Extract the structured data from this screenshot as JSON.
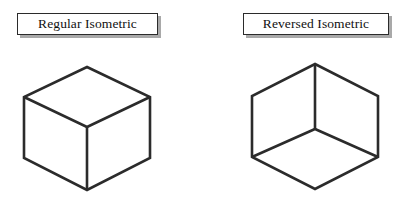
{
  "figure": {
    "background_color": "#ffffff",
    "line_color": "#2b2b2b",
    "shadow_color": "#a9a9a9",
    "text_color": "#111111"
  },
  "panels": [
    {
      "id": "regular",
      "label": "Regular Isometric",
      "cube": {
        "orientation": "viewed-from-above",
        "visible_faces": [
          "top",
          "left",
          "right"
        ],
        "interior_vertex": "pointing-down",
        "apex_vertex": "top",
        "description": "Standard isometric cube: top face visible as a diamond, interior Y-junction points downward."
      }
    },
    {
      "id": "reversed",
      "label": "Reversed Isometric",
      "cube": {
        "orientation": "viewed-from-below",
        "visible_faces": [
          "bottom",
          "left",
          "right"
        ],
        "interior_vertex": "pointing-up",
        "apex_vertex": "bottom",
        "description": "Reversed isometric cube: bottom face visible as a diamond, interior Y-junction points upward."
      }
    }
  ],
  "geometry": {
    "regular": {
      "outline": "63,9 0,39 0,100 63,132 126,100 126,39",
      "top_face": "63,9 126,39 63,69 0,39",
      "spoke_center": "63,69",
      "spoke_down_to": "63,132",
      "spoke_left_to": "0,39",
      "spoke_right_to": "126,39"
    },
    "reversed": {
      "outline": "63,6 126,38 126,99 63,129 0,99 0,38",
      "bottom_face": "63,71 126,99 63,129 0,99",
      "spoke_center": "63,71",
      "spoke_up_to": "63,6",
      "spoke_left_to": "0,38",
      "spoke_right_to": "126,38"
    }
  }
}
